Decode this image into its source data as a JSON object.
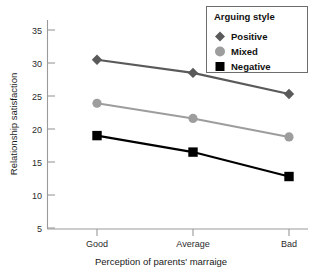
{
  "chart_data": {
    "type": "line",
    "title": "",
    "xlabel": "Perception of parents' marraige",
    "ylabel": "Relationship satisfaction",
    "categories": [
      "Good",
      "Average",
      "Bad"
    ],
    "x_tick_labels": [
      "Good",
      "Average",
      "Bad"
    ],
    "y_tick_labels": [
      "5",
      "10",
      "15",
      "20",
      "25",
      "30",
      "35"
    ],
    "y_ticks": [
      5,
      10,
      15,
      20,
      25,
      30,
      35
    ],
    "ylim": [
      5,
      36
    ],
    "grid": false,
    "legend_position": "top-right",
    "legend_title": "Arguing style",
    "series": [
      {
        "name": "Positive",
        "marker": "diamond",
        "color": "#5a5a5a",
        "values": [
          30.5,
          28.5,
          25.3
        ]
      },
      {
        "name": "Mixed",
        "marker": "circle",
        "color": "#9d9d9d",
        "values": [
          23.9,
          21.6,
          18.8
        ]
      },
      {
        "name": "Negative",
        "marker": "square",
        "color": "#000000",
        "values": [
          19.0,
          16.5,
          12.8
        ]
      }
    ]
  },
  "axes": {
    "y_axis_title": "Relationship satisfaction",
    "x_axis_title": "Perception of parents' marraige",
    "y_tick_5": "5",
    "y_tick_10": "10",
    "y_tick_15": "15",
    "y_tick_20": "20",
    "y_tick_25": "25",
    "y_tick_30": "30",
    "y_tick_35": "35",
    "x_tick_good": "Good",
    "x_tick_average": "Average",
    "x_tick_bad": "Bad"
  },
  "legend": {
    "title": "Arguing style",
    "items": [
      {
        "label": "Positive",
        "marker": "diamond-marker-icon",
        "color": "#5a5a5a"
      },
      {
        "label": "Mixed",
        "marker": "circle-marker-icon",
        "color": "#9d9d9d"
      },
      {
        "label": "Negative",
        "marker": "square-marker-icon",
        "color": "#000000"
      }
    ]
  },
  "colors": {
    "positive": "#5a5a5a",
    "mixed": "#9d9d9d",
    "negative": "#000000",
    "axis": "#9a9a9a",
    "text": "#1a1a1a",
    "background": "#ffffff"
  }
}
